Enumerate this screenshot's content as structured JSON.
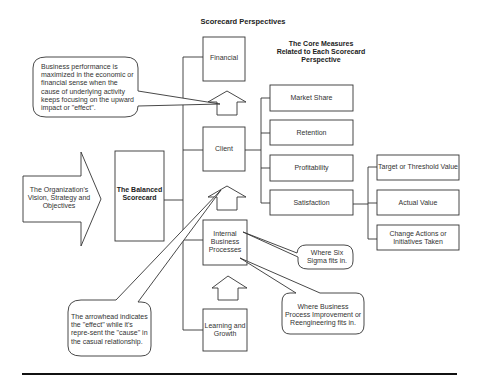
{
  "title": "Scorecard Perspectives",
  "measures_heading": "The Core Measures Related to Each Scorecard Perspective",
  "input_arrow": {
    "label": "The Organization's Vision, Strategy and Objectives"
  },
  "center_box": {
    "label": "The Balanced Scorecard"
  },
  "perspectives": [
    {
      "label": "Financial"
    },
    {
      "label": "Client"
    },
    {
      "label": "Internal Business Processes"
    },
    {
      "label": "Learning and Growth"
    }
  ],
  "client_measures": [
    {
      "label": "Market Share"
    },
    {
      "label": "Retention"
    },
    {
      "label": "Profitability"
    },
    {
      "label": "Satisfaction"
    }
  ],
  "satisfaction_measures": [
    {
      "label": "Target or Threshold Value"
    },
    {
      "label": "Actual Value"
    },
    {
      "label": "Change Actions or Initiatives Taken"
    }
  ],
  "callouts": {
    "business_performance": "Business performance is maximized in the economic or financial sense when the cause of underlying activity keeps focusing on the upward impact or \"effect\".",
    "arrowhead": "The arrowhead indicates the \"effect\" while it's repre-sent the \"cause\" in the casual relationship.",
    "six_sigma": "Where Six Sigma fits in.",
    "bpr": "Where Business Process Improvement or Reengineering fits in."
  },
  "colors": {
    "stroke": "#333333",
    "text": "#333333",
    "background": "#ffffff"
  }
}
